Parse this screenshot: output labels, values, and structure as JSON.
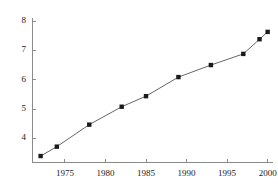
{
  "chart_data": {
    "type": "line",
    "title": "",
    "subtitle": "",
    "xlabel": "",
    "ylabel": "",
    "grid": false,
    "legend": false,
    "legend_position": "none",
    "marker": "square",
    "marker_color": "#1a1a1a",
    "line_color": "#555555",
    "background_color": "#ffffff",
    "axis_color": "#8a8a8a",
    "xlim": [
      1971.0,
      2000.6
    ],
    "ylim": [
      3.18,
      8.12
    ],
    "xticks": [
      1975,
      1980,
      1985,
      1990,
      1995,
      2000
    ],
    "xtick_labels": [
      "1975",
      "1980",
      "1985",
      "1990",
      "1995",
      "2000"
    ],
    "yticks": [
      4,
      5,
      6,
      7,
      8
    ],
    "ytick_labels": [
      "4",
      "5",
      "6",
      "7",
      "8"
    ],
    "x": [
      1972,
      1974,
      1978,
      1982,
      1985,
      1989,
      1993,
      1997,
      1999,
      2000
    ],
    "values": [
      3.4,
      3.72,
      4.47,
      5.08,
      5.44,
      6.09,
      6.5,
      6.88,
      7.38,
      7.63
    ],
    "points": [
      {
        "x": 1972,
        "y": 3.4
      },
      {
        "x": 1974,
        "y": 3.72
      },
      {
        "x": 1978,
        "y": 4.47
      },
      {
        "x": 1982,
        "y": 5.08
      },
      {
        "x": 1985,
        "y": 5.44
      },
      {
        "x": 1989,
        "y": 6.09
      },
      {
        "x": 1993,
        "y": 6.5
      },
      {
        "x": 1997,
        "y": 6.88
      },
      {
        "x": 1999,
        "y": 7.38
      },
      {
        "x": 2000,
        "y": 7.63
      }
    ]
  }
}
